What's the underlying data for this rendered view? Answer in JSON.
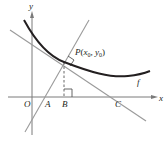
{
  "diagram": {
    "axes": {
      "x_label": "x",
      "y_label": "y",
      "origin_label": "O"
    },
    "curve": {
      "label": "f",
      "color": "#231f20"
    },
    "lines": {
      "tangent_color": "#9a9a9a",
      "normal_color": "#9a9a9a"
    },
    "points": {
      "P": {
        "label": "P",
        "coords_open": "(",
        "x_sub_base": "x",
        "x_sub": "0",
        "sep": ", ",
        "y_sub_base": "y",
        "y_sub": "0",
        "coords_close": ")"
      },
      "A": {
        "label": "A"
      },
      "B": {
        "label": "B"
      },
      "C": {
        "label": "C"
      }
    },
    "axis_color": "#7a7a7a"
  }
}
